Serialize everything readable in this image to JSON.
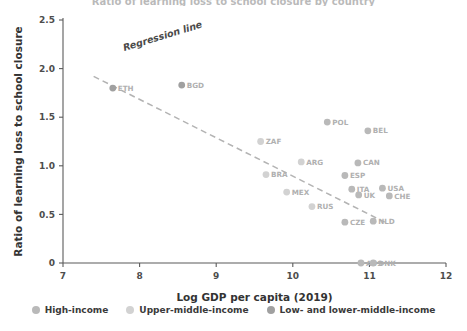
{
  "chart_data": {
    "type": "scatter",
    "title": "",
    "xlabel": "Log GDP per capita (2019)",
    "ylabel": "Ratio of learning loss to school closure",
    "xlim": [
      7,
      12
    ],
    "ylim": [
      0,
      2.5
    ],
    "xticks": [
      "7",
      "8",
      "9",
      "10",
      "11",
      "12"
    ],
    "yticks": [
      "0",
      "0.5",
      "1.0",
      "1.5",
      "2.0",
      "2.5"
    ],
    "grid": false,
    "legend_position": "bottom",
    "annotations": [
      {
        "text": "Regression line",
        "x": 7.8,
        "y": 2.18,
        "rotation": -17
      }
    ],
    "trendline": {
      "name": "Regression line",
      "style": "dashed",
      "color": "#b3b3b3",
      "x_start": 7.4,
      "y_start": 1.92,
      "x_end": 11.2,
      "y_end": 0.42
    },
    "series": [
      {
        "name": "High-income",
        "color": "#b9b9b9",
        "points": [
          {
            "label": "POL",
            "x": 10.45,
            "y": 1.45
          },
          {
            "label": "BEL",
            "x": 10.98,
            "y": 1.36
          },
          {
            "label": "CAN",
            "x": 10.85,
            "y": 1.03
          },
          {
            "label": "ESP",
            "x": 10.68,
            "y": 0.9
          },
          {
            "label": "ITA",
            "x": 10.77,
            "y": 0.76
          },
          {
            "label": "UK",
            "x": 10.86,
            "y": 0.7
          },
          {
            "label": "USA",
            "x": 11.17,
            "y": 0.77
          },
          {
            "label": "CHE",
            "x": 11.26,
            "y": 0.69
          },
          {
            "label": "CZE",
            "x": 10.68,
            "y": 0.42
          },
          {
            "label": "NLD",
            "x": 11.05,
            "y": 0.43
          },
          {
            "label": "AUS",
            "x": 10.89,
            "y": 0.0
          },
          {
            "label": "DNK",
            "x": 11.05,
            "y": 0.0
          }
        ]
      },
      {
        "name": "Upper-middle-income",
        "color": "#d2d2d2",
        "points": [
          {
            "label": "ZAF",
            "x": 9.58,
            "y": 1.25
          },
          {
            "label": "ARG",
            "x": 10.11,
            "y": 1.04
          },
          {
            "label": "BRA",
            "x": 9.65,
            "y": 0.91
          },
          {
            "label": "MEX",
            "x": 9.92,
            "y": 0.73
          },
          {
            "label": "RUS",
            "x": 10.25,
            "y": 0.58
          }
        ]
      },
      {
        "name": "Low- and lower-middle-income",
        "color": "#a0a0a0",
        "points": [
          {
            "label": "ETH",
            "x": 7.65,
            "y": 1.8
          },
          {
            "label": "BGD",
            "x": 8.55,
            "y": 1.83
          }
        ]
      }
    ]
  },
  "legend": {
    "items": [
      {
        "label": "High-income",
        "color": "#b9b9b9"
      },
      {
        "label": "Upper-middle-income",
        "color": "#d2d2d2"
      },
      {
        "label": "Low- and lower-middle-income",
        "color": "#a0a0a0"
      }
    ]
  },
  "axes": {
    "x_title": "Log GDP per capita (2019)",
    "y_title": "Ratio of learning loss to school closure"
  },
  "top_clipped_text": "Ratio of learning loss to school closure by country"
}
